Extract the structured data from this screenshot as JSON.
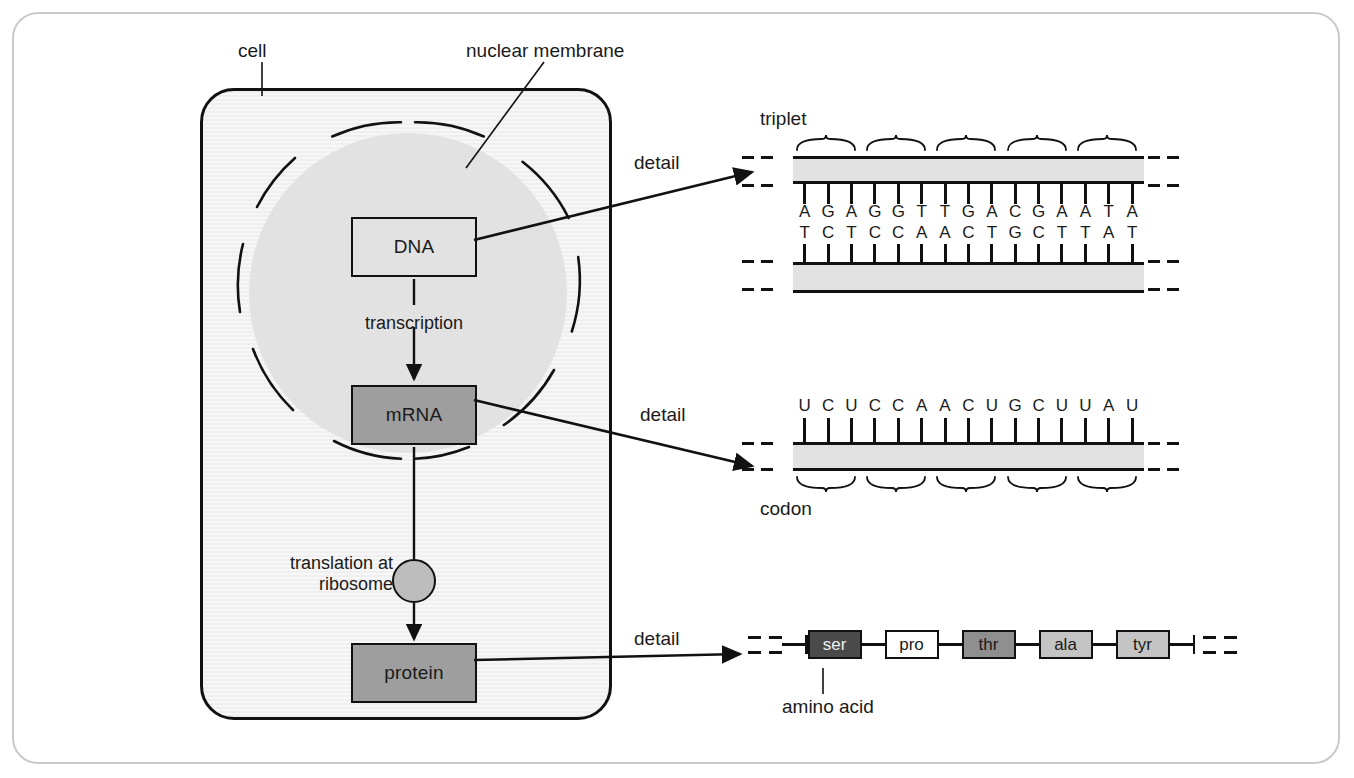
{
  "diagram": {
    "colors": {
      "frame_border": "#c9c9c9",
      "outline": "#111111",
      "cytoplasm": "#f2f2f2",
      "nucleus_fill": "#e2e2e2",
      "dna_box_fill": "#e2e2e2",
      "mrna_box_fill": "#9e9e9e",
      "protein_box_fill": "#9e9e9e",
      "ribosome_fill": "#bdbdbd",
      "strand_fill": "#e2e2e2"
    }
  },
  "cell": {
    "label": "cell",
    "nuclear_membrane_label": "nuclear membrane",
    "nodes": {
      "dna": "DNA",
      "mrna": "mRNA",
      "protein": "protein"
    },
    "steps": {
      "transcription": "transcription",
      "translation": "translation at\nribosome",
      "translation_line1": "translation at",
      "translation_line2": "ribosome"
    },
    "ribosome_name": "ribosome"
  },
  "detail_labels": {
    "dna": "detail",
    "mrna": "detail",
    "protein": "detail"
  },
  "dna_detail": {
    "caption_triplet": "triplet",
    "top_strand": [
      "A",
      "G",
      "A",
      "G",
      "G",
      "T",
      "T",
      "G",
      "A",
      "C",
      "G",
      "A",
      "A",
      "T",
      "A"
    ],
    "bottom_strand": [
      "T",
      "C",
      "T",
      "C",
      "C",
      "A",
      "A",
      "C",
      "T",
      "G",
      "C",
      "T",
      "T",
      "A",
      "T"
    ],
    "triplet_count": 5,
    "base_count": 15
  },
  "mrna_detail": {
    "caption_codon": "codon",
    "bases": [
      "U",
      "C",
      "U",
      "C",
      "C",
      "A",
      "A",
      "C",
      "U",
      "G",
      "C",
      "U",
      "U",
      "A",
      "U"
    ],
    "codon_count": 5,
    "base_count": 15
  },
  "protein_detail": {
    "caption_amino_acid": "amino acid",
    "amino_acids": [
      {
        "label": "ser",
        "fill": "#4a4a4a",
        "text": "#f0f0f0"
      },
      {
        "label": "pro",
        "fill": "#ffffff",
        "text": "#1a1a1a"
      },
      {
        "label": "thr",
        "fill": "#8f8f8f",
        "text": "#1a1a1a"
      },
      {
        "label": "ala",
        "fill": "#c4c4c4",
        "text": "#1a1a1a"
      },
      {
        "label": "tyr",
        "fill": "#c4c4c4",
        "text": "#1a1a1a"
      }
    ]
  }
}
